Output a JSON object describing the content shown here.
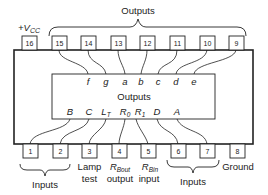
{
  "colors": {
    "line": "#222222",
    "background": "#ffffff"
  },
  "top_group_label": "Outputs",
  "inner_label": "Outputs",
  "vcc_label": "+V",
  "vcc_sub": "CC",
  "top_pins": [
    {
      "num": "16",
      "signal": ""
    },
    {
      "num": "15",
      "signal": "f"
    },
    {
      "num": "14",
      "signal": "g"
    },
    {
      "num": "13",
      "signal": "a"
    },
    {
      "num": "12",
      "signal": "b"
    },
    {
      "num": "11",
      "signal": "c"
    },
    {
      "num": "10",
      "signal": "d"
    },
    {
      "num": "9",
      "signal": "e"
    }
  ],
  "bottom_pins": [
    {
      "num": "1",
      "signal": "B"
    },
    {
      "num": "2",
      "signal": "C"
    },
    {
      "num": "3",
      "signal": "L",
      "signal_sub": "T"
    },
    {
      "num": "4",
      "signal": "R",
      "signal_sub": "0"
    },
    {
      "num": "5",
      "signal": "R",
      "signal_sub": "1"
    },
    {
      "num": "6",
      "signal": "D"
    },
    {
      "num": "7",
      "signal": "A"
    },
    {
      "num": "8",
      "signal": ""
    }
  ],
  "bottom_labels": {
    "inputs_left": "Inputs",
    "lamp_test_1": "Lamp",
    "lamp_test_2": "test",
    "rbo_main": "R",
    "rbo_sub": "Bout",
    "rbo_line2": "output",
    "rbi_main": "R",
    "rbi_sub": "Bin",
    "rbi_line2": "input",
    "inputs_right": "Inputs",
    "ground": "Ground"
  }
}
